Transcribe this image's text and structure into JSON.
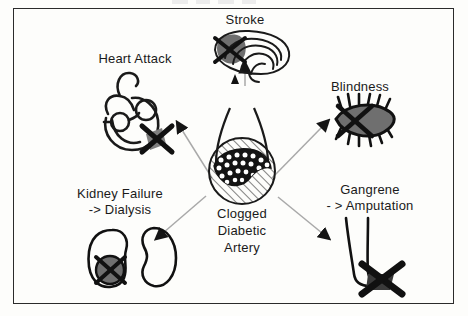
{
  "figure": {
    "title_visible": false,
    "background_color": "#fdfdfb",
    "border_color": "#2b2b2b",
    "ink_color": "#1a1a1a",
    "shade_color": "#828282",
    "arrow_line_color": "#a8a8a8",
    "width": 468,
    "height": 316
  },
  "center": {
    "name": "clogged-diabetic-artery",
    "label_line1": "Clogged",
    "label_line2": "Diabetic",
    "label_line3": "Artery",
    "illustration": "artery-cross-section-with-plaque"
  },
  "complications": [
    {
      "id": "heart-attack",
      "label": "Heart Attack",
      "label_line2": "",
      "illustration": "heart-with-blocked-coronary-artery",
      "marker": "black-x-starburst"
    },
    {
      "id": "stroke",
      "label": "Stroke",
      "label_line2": "",
      "illustration": "brain-with-blocked-vessel",
      "marker": "black-x"
    },
    {
      "id": "blindness",
      "label": "Blindness",
      "label_line2": "",
      "illustration": "eye-with-lashes",
      "marker": "black-x"
    },
    {
      "id": "kidney-failure",
      "label": "Kidney Failure",
      "label_line2": "-> Dialysis",
      "illustration": "two-kidneys",
      "marker": "black-x-over-shaded-circle"
    },
    {
      "id": "gangrene",
      "label": "Gangrene",
      "label_line2": "- > Amputation",
      "illustration": "leg-and-foot",
      "marker": "black-x"
    }
  ],
  "arrows": [
    {
      "id": "arrow-to-heart-attack",
      "from": "clogged-diabetic-artery",
      "to": "heart-attack"
    },
    {
      "id": "arrow-to-stroke",
      "from": "clogged-diabetic-artery",
      "to": "stroke"
    },
    {
      "id": "arrow-to-blindness",
      "from": "clogged-diabetic-artery",
      "to": "blindness"
    },
    {
      "id": "arrow-to-kidney-failure",
      "from": "clogged-diabetic-artery",
      "to": "kidney-failure"
    },
    {
      "id": "arrow-to-gangrene",
      "from": "clogged-diabetic-artery",
      "to": "gangrene"
    }
  ]
}
